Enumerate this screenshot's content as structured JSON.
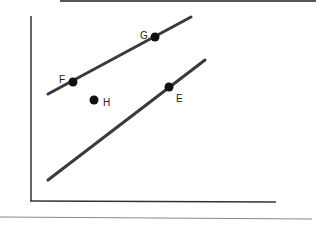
{
  "diagram": {
    "type": "line-graph-with-points",
    "axes": {
      "x_label": "",
      "y_label": ""
    },
    "lines": [
      {
        "name": "upper-line",
        "from": [
          48,
          94
        ],
        "to": [
          191,
          17
        ]
      },
      {
        "name": "lower-line",
        "from": [
          48,
          180
        ],
        "to": [
          205,
          60
        ]
      }
    ],
    "points": [
      {
        "label": "F",
        "x": 73,
        "y": 82
      },
      {
        "label": "G",
        "x": 155,
        "y": 37
      },
      {
        "label": "H",
        "x": 94,
        "y": 100
      },
      {
        "label": "E",
        "x": 169,
        "y": 87
      }
    ],
    "colors": {
      "line": "#3a3a3a",
      "point": "#111111",
      "axis": "#333333"
    }
  },
  "labels": {
    "F": "F",
    "G": "G",
    "H": "H",
    "E": "E"
  }
}
